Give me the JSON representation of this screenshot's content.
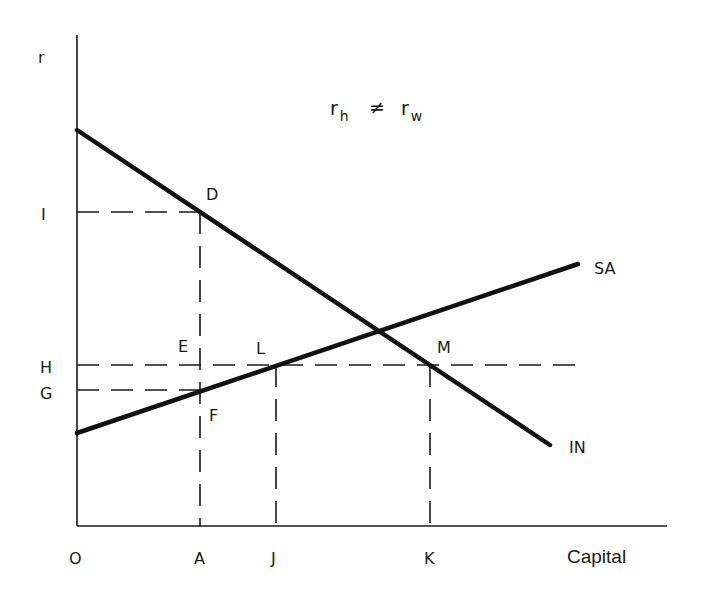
{
  "diagram": {
    "title_parts": {
      "r1": "r",
      "sub1": "h",
      "neq": "≠",
      "r2": "r",
      "sub2": "w"
    },
    "axes": {
      "y_label": "r",
      "x_label": "Capital",
      "origin_label": "O"
    },
    "y_ticks": [
      {
        "label": "I"
      },
      {
        "label": "H"
      },
      {
        "label": "G"
      }
    ],
    "x_ticks": [
      {
        "label": "A"
      },
      {
        "label": "J"
      },
      {
        "label": "K"
      }
    ],
    "curves": [
      {
        "name": "IN",
        "label": "IN",
        "description": "downward-sloping investment demand line"
      },
      {
        "name": "SA",
        "label": "SA",
        "description": "upward-sloping savings supply line"
      }
    ],
    "points": [
      {
        "label": "D"
      },
      {
        "label": "E"
      },
      {
        "label": "F"
      },
      {
        "label": "L"
      },
      {
        "label": "M"
      }
    ],
    "colors": {
      "ink": "#1a1a1a",
      "background": "#ffffff"
    }
  }
}
